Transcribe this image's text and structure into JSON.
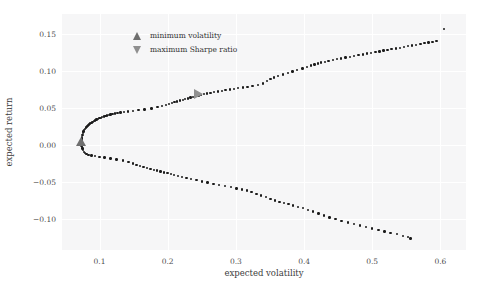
{
  "chart_data": {
    "type": "scatter",
    "title": "",
    "xlabel": "expected volatility",
    "ylabel": "expected return",
    "xlim": [
      0.045,
      0.6375
    ],
    "ylim": [
      -0.1425,
      0.1775
    ],
    "xticks": [
      "0.1",
      "0.2",
      "0.3",
      "0.4",
      "0.5",
      "0.6"
    ],
    "xtick_values": [
      0.1,
      0.2,
      0.3,
      0.4,
      0.5,
      0.6
    ],
    "yticks": [
      "0.15",
      "0.10",
      "0.05",
      "0.00",
      "−0.05",
      "−0.10"
    ],
    "ytick_values": [
      0.15,
      0.1,
      0.05,
      0.0,
      -0.05,
      -0.1
    ],
    "grid": true,
    "grid_color": "#ffffff",
    "axes_facecolor": "#f6f6f7",
    "figure_facecolor": "#ffffff",
    "point_color": "#1b1b1b",
    "legend_position": "upper left",
    "legend": [
      {
        "label": "minimum volatility",
        "marker": "triangle-up",
        "color": "#6e6e6e"
      },
      {
        "label": "maximum Sharpe ratio",
        "marker": "triangle-down",
        "color": "#8f8f8f"
      }
    ],
    "markers": [
      {
        "name": "minimum-volatility",
        "marker": "triangle-up",
        "color": "#6f6f6f",
        "x": 0.0725,
        "y": 0.004
      },
      {
        "name": "maximum-sharpe-ratio",
        "marker": "triangle-right",
        "color": "#909090",
        "x": 0.2455,
        "y": 0.0695
      }
    ],
    "series": [
      {
        "name": "efficient-frontier-upper-branch",
        "points": [
          [
            0.074,
            0.0085
          ],
          [
            0.0745,
            0.011
          ],
          [
            0.075,
            0.0135
          ],
          [
            0.0757,
            0.016
          ],
          [
            0.0765,
            0.018
          ],
          [
            0.0775,
            0.02
          ],
          [
            0.0787,
            0.0218
          ],
          [
            0.08,
            0.0235
          ],
          [
            0.0815,
            0.025
          ],
          [
            0.083,
            0.0263
          ],
          [
            0.0845,
            0.0275
          ],
          [
            0.0862,
            0.0288
          ],
          [
            0.088,
            0.03
          ],
          [
            0.0898,
            0.0312
          ],
          [
            0.0917,
            0.0323
          ],
          [
            0.0936,
            0.0333
          ],
          [
            0.0956,
            0.0343
          ],
          [
            0.0976,
            0.0352
          ],
          [
            0.0997,
            0.0361
          ],
          [
            0.1018,
            0.0369
          ],
          [
            0.104,
            0.0377
          ],
          [
            0.1063,
            0.0385
          ],
          [
            0.1086,
            0.0392
          ],
          [
            0.111,
            0.0399
          ],
          [
            0.1135,
            0.0406
          ],
          [
            0.116,
            0.0413
          ],
          [
            0.119,
            0.042
          ],
          [
            0.1225,
            0.0427
          ],
          [
            0.1265,
            0.0434
          ],
          [
            0.131,
            0.0441
          ],
          [
            0.136,
            0.0448
          ],
          [
            0.142,
            0.0455
          ],
          [
            0.149,
            0.0463
          ],
          [
            0.157,
            0.0472
          ],
          [
            0.166,
            0.0482
          ],
          [
            0.176,
            0.0495
          ],
          [
            0.185,
            0.051
          ],
          [
            0.192,
            0.0525
          ],
          [
            0.1975,
            0.054
          ],
          [
            0.202,
            0.0553
          ],
          [
            0.206,
            0.0566
          ],
          [
            0.21,
            0.0578
          ],
          [
            0.214,
            0.059
          ],
          [
            0.218,
            0.0601
          ],
          [
            0.222,
            0.0612
          ],
          [
            0.2258,
            0.0622
          ],
          [
            0.2296,
            0.0632
          ],
          [
            0.2334,
            0.0642
          ],
          [
            0.2372,
            0.0652
          ],
          [
            0.241,
            0.0661
          ],
          [
            0.245,
            0.067
          ],
          [
            0.2492,
            0.0679
          ],
          [
            0.2535,
            0.0688
          ],
          [
            0.258,
            0.0697
          ],
          [
            0.2628,
            0.0706
          ],
          [
            0.268,
            0.0715
          ],
          [
            0.2735,
            0.0724
          ],
          [
            0.2792,
            0.0733
          ],
          [
            0.285,
            0.0742
          ],
          [
            0.291,
            0.0751
          ],
          [
            0.2972,
            0.076
          ],
          [
            0.3035,
            0.0769
          ],
          [
            0.31,
            0.0778
          ],
          [
            0.317,
            0.0788
          ],
          [
            0.3245,
            0.08
          ],
          [
            0.3325,
            0.0815
          ],
          [
            0.34,
            0.0835
          ],
          [
            0.346,
            0.087
          ],
          [
            0.351,
            0.0895
          ],
          [
            0.356,
            0.0915
          ],
          [
            0.362,
            0.0935
          ],
          [
            0.369,
            0.0955
          ],
          [
            0.376,
            0.0975
          ],
          [
            0.383,
            0.0995
          ],
          [
            0.39,
            0.1015
          ],
          [
            0.3975,
            0.1035
          ],
          [
            0.404,
            0.1055
          ],
          [
            0.41,
            0.1075
          ],
          [
            0.4155,
            0.109
          ],
          [
            0.42,
            0.1102
          ],
          [
            0.425,
            0.1115
          ],
          [
            0.4305,
            0.1128
          ],
          [
            0.436,
            0.114
          ],
          [
            0.442,
            0.1152
          ],
          [
            0.448,
            0.1163
          ],
          [
            0.454,
            0.1174
          ],
          [
            0.4605,
            0.1185
          ],
          [
            0.467,
            0.1196
          ],
          [
            0.4735,
            0.1207
          ],
          [
            0.48,
            0.1218
          ],
          [
            0.4862,
            0.1228
          ],
          [
            0.4925,
            0.1238
          ],
          [
            0.4985,
            0.1248
          ],
          [
            0.5045,
            0.1258
          ],
          [
            0.5105,
            0.1268
          ],
          [
            0.5165,
            0.1278
          ],
          [
            0.5225,
            0.1288
          ],
          [
            0.5285,
            0.1298
          ],
          [
            0.5345,
            0.1308
          ],
          [
            0.5405,
            0.1318
          ],
          [
            0.5465,
            0.1328
          ],
          [
            0.5525,
            0.1338
          ],
          [
            0.5585,
            0.1348
          ],
          [
            0.5645,
            0.1358
          ],
          [
            0.5705,
            0.1368
          ],
          [
            0.5765,
            0.1378
          ],
          [
            0.5825,
            0.1388
          ],
          [
            0.5885,
            0.1398
          ],
          [
            0.5945,
            0.1408
          ],
          [
            0.605,
            0.157
          ]
        ]
      },
      {
        "name": "efficient-frontier-lower-branch",
        "points": [
          [
            0.0735,
            0.0
          ],
          [
            0.074,
            -0.0025
          ],
          [
            0.0748,
            -0.005
          ],
          [
            0.0758,
            -0.0072
          ],
          [
            0.0772,
            -0.0092
          ],
          [
            0.079,
            -0.011
          ],
          [
            0.0812,
            -0.0125
          ],
          [
            0.084,
            -0.0136
          ],
          [
            0.088,
            -0.0145
          ],
          [
            0.0935,
            -0.0153
          ],
          [
            0.1,
            -0.0162
          ],
          [
            0.1075,
            -0.0172
          ],
          [
            0.116,
            -0.0183
          ],
          [
            0.125,
            -0.0196
          ],
          [
            0.1345,
            -0.0212
          ],
          [
            0.1425,
            -0.0232
          ],
          [
            0.149,
            -0.0252
          ],
          [
            0.1545,
            -0.027
          ],
          [
            0.1595,
            -0.0286
          ],
          [
            0.1645,
            -0.03
          ],
          [
            0.1695,
            -0.0312
          ],
          [
            0.1745,
            -0.0324
          ],
          [
            0.1795,
            -0.0336
          ],
          [
            0.1845,
            -0.0348
          ],
          [
            0.1895,
            -0.036
          ],
          [
            0.1945,
            -0.0372
          ],
          [
            0.1995,
            -0.0384
          ],
          [
            0.2045,
            -0.0396
          ],
          [
            0.2095,
            -0.0408
          ],
          [
            0.215,
            -0.042
          ],
          [
            0.221,
            -0.0433
          ],
          [
            0.2275,
            -0.0447
          ],
          [
            0.2345,
            -0.0462
          ],
          [
            0.242,
            -0.0478
          ],
          [
            0.25,
            -0.0494
          ],
          [
            0.2585,
            -0.051
          ],
          [
            0.267,
            -0.0526
          ],
          [
            0.2755,
            -0.0542
          ],
          [
            0.284,
            -0.0558
          ],
          [
            0.2925,
            -0.0574
          ],
          [
            0.301,
            -0.059
          ],
          [
            0.309,
            -0.0605
          ],
          [
            0.316,
            -0.062
          ],
          [
            0.323,
            -0.064
          ],
          [
            0.33,
            -0.0663
          ],
          [
            0.337,
            -0.0686
          ],
          [
            0.344,
            -0.071
          ],
          [
            0.351,
            -0.0733
          ],
          [
            0.3575,
            -0.0754
          ],
          [
            0.364,
            -0.0772
          ],
          [
            0.3705,
            -0.079
          ],
          [
            0.377,
            -0.0805
          ],
          [
            0.384,
            -0.082
          ],
          [
            0.391,
            -0.0838
          ],
          [
            0.398,
            -0.0858
          ],
          [
            0.4055,
            -0.088
          ],
          [
            0.413,
            -0.0905
          ],
          [
            0.421,
            -0.0932
          ],
          [
            0.429,
            -0.0958
          ],
          [
            0.4375,
            -0.0982
          ],
          [
            0.446,
            -0.1005
          ],
          [
            0.455,
            -0.1028
          ],
          [
            0.464,
            -0.105
          ],
          [
            0.473,
            -0.1072
          ],
          [
            0.482,
            -0.1092
          ],
          [
            0.491,
            -0.1112
          ],
          [
            0.5,
            -0.1132
          ],
          [
            0.509,
            -0.1152
          ],
          [
            0.518,
            -0.1172
          ],
          [
            0.527,
            -0.1192
          ],
          [
            0.536,
            -0.1212
          ],
          [
            0.545,
            -0.1232
          ],
          [
            0.552,
            -0.1252
          ],
          [
            0.556,
            -0.127
          ]
        ]
      },
      {
        "name": "efficient-frontier-vertex-cluster",
        "points": [
          [
            0.0728,
            0.004
          ],
          [
            0.073,
            0.0055
          ],
          [
            0.0732,
            0.007
          ],
          [
            0.0735,
            0.002
          ],
          [
            0.0734,
            0.0005
          ],
          [
            0.0736,
            -0.001
          ],
          [
            0.0729,
            0.003
          ],
          [
            0.0733,
            0.006
          ]
        ]
      }
    ]
  }
}
